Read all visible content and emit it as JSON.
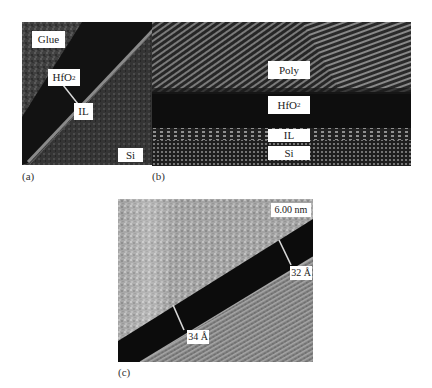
{
  "figure": {
    "panels": [
      {
        "id": "a",
        "caption": "(a)",
        "labels": {
          "glue": "Glue",
          "hfo2_base": "HfO",
          "hfo2_sub": "2",
          "il": "IL",
          "si": "Si"
        }
      },
      {
        "id": "b",
        "caption": "(b)",
        "labels": {
          "poly": "Poly",
          "hfo2_base": "HfO",
          "hfo2_sub": "2",
          "il": "IL",
          "si": "Si"
        }
      },
      {
        "id": "c",
        "caption": "(c)",
        "labels": {
          "scale_bar": "6.00 nm",
          "thickness_right": "32 Å",
          "thickness_left": "34 Å"
        }
      }
    ],
    "colors": {
      "background": "#ffffff",
      "label_box": "#ffffff",
      "dark_layer": "#0d0d0d",
      "glue_gray": "#4a4a4a",
      "si_gray": "#3a3a3a",
      "c_top_gray": "#a8a8a8",
      "c_si_gray": "#8a8a8a"
    }
  }
}
